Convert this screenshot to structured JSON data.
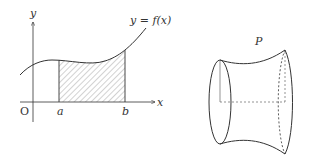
{
  "left_figure": {
    "y_axis_label": "y",
    "x_axis_label": "x",
    "origin_label": "O",
    "a_label": "a",
    "b_label": "b",
    "curve_label": "y = f(x)"
  },
  "right_figure": {
    "solid_label": "P"
  },
  "colors": {
    "stroke": "#333333",
    "hatch": "#555555",
    "background": "#ffffff"
  }
}
